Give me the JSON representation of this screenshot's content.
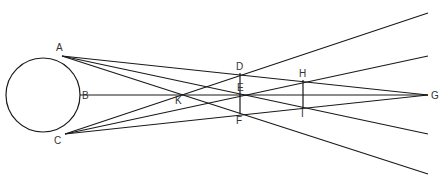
{
  "diagram": {
    "colors": {
      "stroke": "#1a1a1a",
      "label": "#333333",
      "background": "#ffffff"
    },
    "circle": {
      "cx": 43,
      "cy": 95,
      "r": 37
    },
    "points": {
      "A": {
        "label": "A",
        "x": 62,
        "y": 56,
        "lx": 56,
        "ly": 51
      },
      "B": {
        "label": "B",
        "x": 80,
        "y": 95,
        "lx": 82,
        "ly": 99
      },
      "C": {
        "label": "C",
        "x": 65,
        "y": 134,
        "lx": 54,
        "ly": 144
      },
      "D": {
        "label": "D",
        "x": 240,
        "y": 73,
        "lx": 236,
        "ly": 70
      },
      "E": {
        "label": "E",
        "x": 240,
        "y": 95,
        "lx": 237,
        "ly": 91
      },
      "F": {
        "label": "F",
        "x": 240,
        "y": 114,
        "lx": 236,
        "ly": 124
      },
      "G": {
        "label": "G",
        "x": 428,
        "y": 95,
        "lx": 431,
        "ly": 99
      },
      "H": {
        "label": "H",
        "x": 303,
        "y": 80,
        "lx": 299,
        "ly": 77
      },
      "I": {
        "label": "I",
        "x": 303,
        "y": 108,
        "lx": 301,
        "ly": 117
      },
      "K": {
        "label": "K",
        "x": 178,
        "y": 95,
        "lx": 175,
        "ly": 104
      }
    },
    "segments": [
      {
        "name": "axis-BG",
        "x1": 80,
        "y1": 95,
        "x2": 428,
        "y2": 95
      },
      {
        "name": "line-AG",
        "x1": 62,
        "y1": 56,
        "x2": 428,
        "y2": 95
      },
      {
        "name": "line-CG",
        "x1": 65,
        "y1": 134,
        "x2": 428,
        "y2": 95
      },
      {
        "name": "line-A-E-ext",
        "x1": 62,
        "y1": 56,
        "x2": 428,
        "y2": 134
      },
      {
        "name": "line-C-E-ext",
        "x1": 65,
        "y1": 134,
        "x2": 428,
        "y2": 56
      },
      {
        "name": "line-A-K-F-ext",
        "x1": 62,
        "y1": 56,
        "x2": 428,
        "y2": 174
      },
      {
        "name": "line-C-K-D-ext",
        "x1": 65,
        "y1": 134,
        "x2": 428,
        "y2": 13
      },
      {
        "name": "segment-DF",
        "x1": 240,
        "y1": 73,
        "x2": 240,
        "y2": 114
      },
      {
        "name": "segment-HI",
        "x1": 303,
        "y1": 80,
        "x2": 303,
        "y2": 108
      }
    ]
  }
}
